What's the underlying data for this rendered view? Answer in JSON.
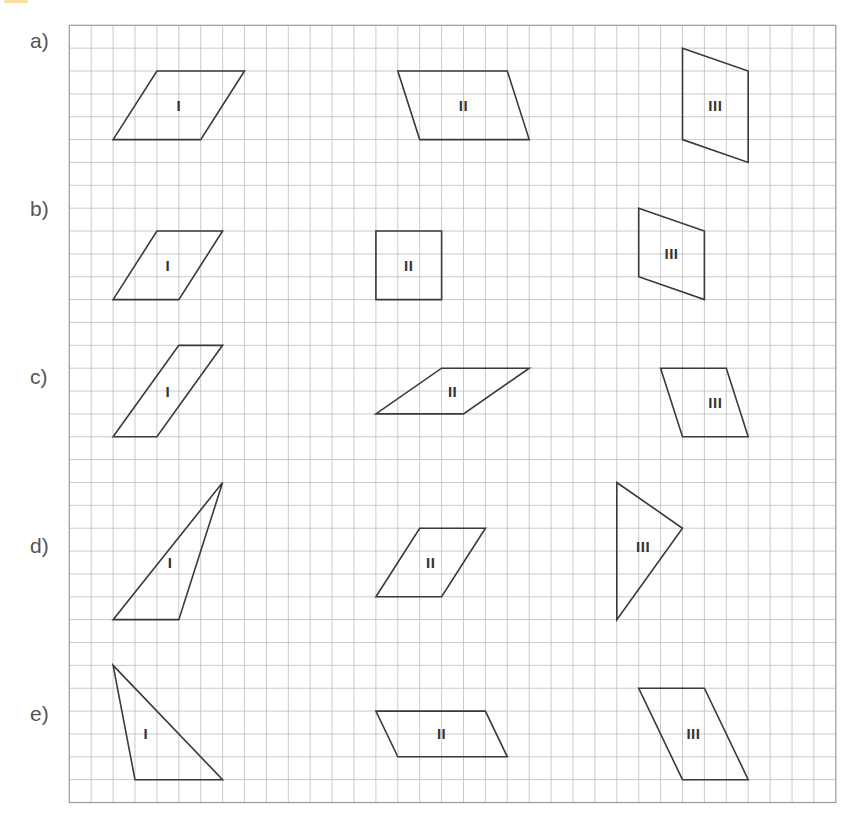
{
  "header": {
    "cut_off_text_fragment_visible": true,
    "accent_color": "#f3d27a"
  },
  "grid": {
    "left": 69.3,
    "top": 25.3,
    "cell_width": 21.9,
    "cell_height": 22.86,
    "columns": 35,
    "rows": 34,
    "line_color": "#bdbdbd",
    "border_color": "#9a9a9a"
  },
  "rows": [
    {
      "label": "a)",
      "label_y": 30,
      "shapes": [
        {
          "numeral": "I",
          "type": "parallelogram",
          "points": [
            [
              4,
              2
            ],
            [
              8,
              2
            ],
            [
              6,
              5
            ],
            [
              2,
              5
            ]
          ],
          "label_pos": [
            5,
            3.5
          ]
        },
        {
          "numeral": "II",
          "type": "parallelogram",
          "points": [
            [
              15,
              2
            ],
            [
              20,
              2
            ],
            [
              21,
              5
            ],
            [
              16,
              5
            ]
          ],
          "label_pos": [
            18,
            3.5
          ]
        },
        {
          "numeral": "III",
          "type": "parallelogram",
          "points": [
            [
              28,
              1
            ],
            [
              31,
              2
            ],
            [
              31,
              6
            ],
            [
              28,
              5
            ]
          ],
          "label_pos": [
            29.5,
            3.5
          ]
        }
      ]
    },
    {
      "label": "b)",
      "label_y": 198,
      "shapes": [
        {
          "numeral": "I",
          "type": "parallelogram",
          "points": [
            [
              4,
              9
            ],
            [
              7,
              9
            ],
            [
              5,
              12
            ],
            [
              2,
              12
            ]
          ],
          "label_pos": [
            4.5,
            10.5
          ]
        },
        {
          "numeral": "II",
          "type": "square",
          "points": [
            [
              14,
              9
            ],
            [
              17,
              9
            ],
            [
              17,
              12
            ],
            [
              14,
              12
            ]
          ],
          "label_pos": [
            15.5,
            10.5
          ]
        },
        {
          "numeral": "III",
          "type": "parallelogram",
          "points": [
            [
              26,
              8
            ],
            [
              29,
              9
            ],
            [
              29,
              12
            ],
            [
              26,
              11
            ]
          ],
          "label_pos": [
            27.5,
            10
          ]
        }
      ]
    },
    {
      "label": "c)",
      "label_y": 366,
      "shapes": [
        {
          "numeral": "I",
          "type": "parallelogram",
          "points": [
            [
              5,
              14
            ],
            [
              7,
              14
            ],
            [
              4,
              18
            ],
            [
              2,
              18
            ]
          ],
          "label_pos": [
            4.5,
            16
          ]
        },
        {
          "numeral": "II",
          "type": "parallelogram",
          "points": [
            [
              17,
              15
            ],
            [
              21,
              15
            ],
            [
              18,
              17
            ],
            [
              14,
              17
            ]
          ],
          "label_pos": [
            17.5,
            16
          ]
        },
        {
          "numeral": "III",
          "type": "parallelogram",
          "points": [
            [
              27,
              15
            ],
            [
              30,
              15
            ],
            [
              31,
              18
            ],
            [
              28,
              18
            ]
          ],
          "label_pos": [
            29.5,
            16.5
          ]
        }
      ]
    },
    {
      "label": "d)",
      "label_y": 535,
      "shapes": [
        {
          "numeral": "I",
          "type": "triangle",
          "points": [
            [
              7,
              20
            ],
            [
              5,
              26
            ],
            [
              2,
              26
            ]
          ],
          "label_pos": [
            4.6,
            23.5
          ]
        },
        {
          "numeral": "II",
          "type": "parallelogram",
          "points": [
            [
              16,
              22
            ],
            [
              19,
              22
            ],
            [
              17,
              25
            ],
            [
              14,
              25
            ]
          ],
          "label_pos": [
            16.5,
            23.5
          ]
        },
        {
          "numeral": "III",
          "type": "triangle",
          "points": [
            [
              25,
              20
            ],
            [
              28,
              22
            ],
            [
              25,
              26
            ]
          ],
          "label_pos": [
            26.2,
            22.8
          ]
        }
      ]
    },
    {
      "label": "e)",
      "label_y": 703,
      "shapes": [
        {
          "numeral": "I",
          "type": "triangle",
          "points": [
            [
              2,
              28
            ],
            [
              7,
              33
            ],
            [
              3,
              33
            ]
          ],
          "label_pos": [
            3.5,
            31
          ]
        },
        {
          "numeral": "II",
          "type": "parallelogram",
          "points": [
            [
              14,
              30
            ],
            [
              19,
              30
            ],
            [
              20,
              32
            ],
            [
              15,
              32
            ]
          ],
          "label_pos": [
            17,
            31
          ]
        },
        {
          "numeral": "III",
          "type": "parallelogram",
          "points": [
            [
              26,
              29
            ],
            [
              29,
              29
            ],
            [
              31,
              33
            ],
            [
              28,
              33
            ]
          ],
          "label_pos": [
            28.5,
            31
          ]
        }
      ]
    }
  ]
}
